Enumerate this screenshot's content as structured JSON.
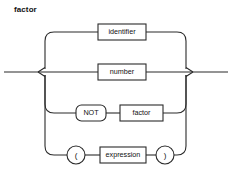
{
  "diagram": {
    "title": "factor",
    "type": "railroad-syntax-diagram",
    "rule_name": "factor",
    "line_color": "#2b2b2b",
    "background_color": "#ffffff",
    "text_color": "#111111",
    "alternatives": [
      {
        "index": 0,
        "row_y": 32,
        "items": [
          {
            "label": "identifier",
            "shape": "rect",
            "kind": "nonterminal",
            "x": 98,
            "y": 24,
            "w": 48,
            "h": 16
          }
        ]
      },
      {
        "index": 1,
        "row_y": 72,
        "items": [
          {
            "label": "number",
            "shape": "rect",
            "kind": "nonterminal",
            "x": 98,
            "y": 64,
            "w": 48,
            "h": 16
          }
        ]
      },
      {
        "index": 2,
        "row_y": 113,
        "items": [
          {
            "label": "NOT",
            "shape": "round",
            "kind": "terminal",
            "x": 76,
            "y": 105,
            "w": 30,
            "h": 16
          },
          {
            "label": "factor",
            "shape": "rect",
            "kind": "nonterminal",
            "x": 120,
            "y": 105,
            "w": 43,
            "h": 16
          }
        ]
      },
      {
        "index": 3,
        "row_y": 155,
        "items": [
          {
            "label": "(",
            "shape": "circle",
            "kind": "terminal",
            "x": 67,
            "y": 146,
            "w": 18,
            "h": 18
          },
          {
            "label": "expression",
            "shape": "rect",
            "kind": "nonterminal",
            "x": 100,
            "y": 147,
            "w": 46,
            "h": 16
          },
          {
            "label": ")",
            "shape": "circle",
            "kind": "terminal",
            "x": 156,
            "y": 146,
            "w": 18,
            "h": 18
          }
        ]
      }
    ],
    "rails": {
      "entry_x": 4,
      "left_trunk_x": 45,
      "right_trunk_x": 186,
      "exit_x": 228,
      "main_y": 72,
      "corner_radius": 9
    }
  }
}
